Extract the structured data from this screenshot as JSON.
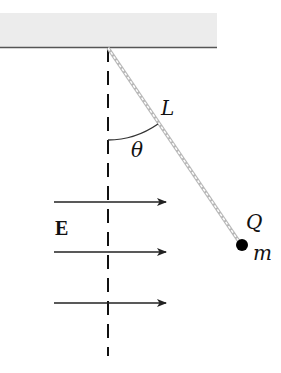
{
  "diagram": {
    "labels": {
      "length": "L",
      "angle": "θ",
      "field": "E",
      "charge": "Q",
      "mass": "m"
    },
    "elements": {
      "ceiling": {
        "x": 0,
        "y": 13,
        "width": 217,
        "height": 35,
        "fill": "#ececec",
        "edge_color": "#555555"
      },
      "pivot": {
        "x": 108,
        "y": 48
      },
      "vertical_reference": {
        "x": 108,
        "y_start": 48,
        "y_end": 356,
        "style": "dashed"
      },
      "string": {
        "from": [
          108,
          48
        ],
        "to": [
          240,
          244
        ],
        "style": "dashed-double",
        "color": "#aaaaaa"
      },
      "bob": {
        "cx": 242,
        "cy": 245,
        "r": 6,
        "color": "#000000"
      },
      "field_arrows": [
        {
          "y": 202,
          "x_start": 54,
          "x_end": 166
        },
        {
          "y": 252,
          "x_start": 54,
          "x_end": 166
        },
        {
          "y": 303,
          "x_start": 54,
          "x_end": 166
        }
      ],
      "angle_arc": {
        "center": [
          108,
          48
        ],
        "radius": 92
      }
    }
  }
}
